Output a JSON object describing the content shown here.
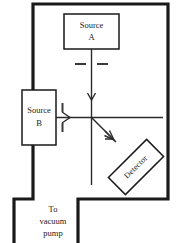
{
  "diagram": {
    "type": "schematic",
    "background_color": "#ffffff",
    "line_color": "#1a1a1a",
    "beam_color": "#2b2b2b"
  },
  "chamber": {
    "name": "vacuum-chamber",
    "wall_color": "#1a1a1a"
  },
  "sources": [
    {
      "id": "source-a",
      "line1": "Source",
      "line2": "A",
      "position": "top-center",
      "beam_direction": "downward"
    },
    {
      "id": "source-b",
      "line1": "Source",
      "line2": "B",
      "position": "middle-left",
      "beam_direction": "rightward"
    }
  ],
  "detector": {
    "id": "detector",
    "label": "Detector",
    "rotation_deg": -45,
    "position": "lower-right"
  },
  "pump": {
    "id": "vacuum-pump-port",
    "line1": "To",
    "line2": "vacuum",
    "line3": "pump"
  },
  "collimators": [
    {
      "id": "collimator-a",
      "orientation": "horizontal",
      "belongs_to": "source-a"
    },
    {
      "id": "collimator-b",
      "orientation": "vertical",
      "belongs_to": "source-b"
    }
  ]
}
